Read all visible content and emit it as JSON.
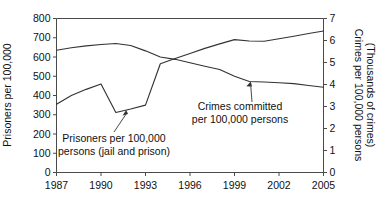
{
  "chart_data": {
    "type": "line",
    "title": "",
    "subtitle": "",
    "xlabel": "",
    "ylabel": "Prisoners per 100,000",
    "y2label_line1": "Crimes per 100,000 persons",
    "y2label_line2": "(Thousands of crimes)",
    "grid": false,
    "legend_position": "none",
    "x": [
      1987,
      1988,
      1989,
      1990,
      1991,
      1992,
      1993,
      1994,
      1995,
      1996,
      1997,
      1998,
      1999,
      2000,
      2001,
      2002,
      2003,
      2004,
      2005
    ],
    "xlim": [
      1987,
      2005
    ],
    "xticks": [
      1987,
      1990,
      1993,
      1996,
      1999,
      2002,
      2005
    ],
    "xticklabels": [
      "1987",
      "1990",
      "1993",
      "1996",
      "1999",
      "2002",
      "2005"
    ],
    "ylim": [
      0,
      800
    ],
    "yticks": [
      0,
      100,
      200,
      300,
      400,
      500,
      600,
      700,
      800
    ],
    "yticklabels": [
      "0",
      "100",
      "200",
      "300",
      "400",
      "500",
      "600",
      "700",
      "800"
    ],
    "y2lim": [
      0,
      7
    ],
    "y2ticks": [
      0,
      1,
      2,
      3,
      4,
      5,
      6,
      7
    ],
    "y2ticklabels": [
      "0",
      "1",
      "2",
      "3",
      "4",
      "5",
      "6",
      "7"
    ],
    "series": [
      {
        "name": "Prisoners per 100,000 persons (jail and prison)",
        "axis": "left",
        "units": "prisoners per 100,000",
        "values": [
          355,
          400,
          432,
          460,
          312,
          330,
          350,
          565,
          592,
          618,
          645,
          668,
          690,
          683,
          682,
          695,
          708,
          722,
          735
        ]
      },
      {
        "name": "Crimes committed per 100,000 persons",
        "axis": "right",
        "units": "thousands of crimes per 100,000 persons",
        "values_left_scale": [
          635,
          648,
          658,
          665,
          670,
          660,
          632,
          600,
          588,
          570,
          552,
          535,
          500,
          473,
          470,
          466,
          462,
          452,
          443
        ],
        "values": [
          5.56,
          5.67,
          5.76,
          5.82,
          5.86,
          5.78,
          5.53,
          5.25,
          5.15,
          4.99,
          4.83,
          4.68,
          4.38,
          4.14,
          4.11,
          4.08,
          4.04,
          3.96,
          3.88
        ]
      }
    ],
    "annotations": [
      {
        "id": "prisoners-annotation",
        "line1": "Prisoners per 100,000",
        "line2": "persons (jail and prison)",
        "points_to_year": 1991.7,
        "points_to_value": 325
      },
      {
        "id": "crimes-annotation",
        "line1": "Crimes committed",
        "line2": "per 100,000 persons",
        "points_to_year": 2000.1,
        "points_to_value": 472
      }
    ],
    "colors": {
      "line": "#333333",
      "axis": "#4a4a4a",
      "text": "#111111",
      "background": "#ffffff"
    }
  }
}
